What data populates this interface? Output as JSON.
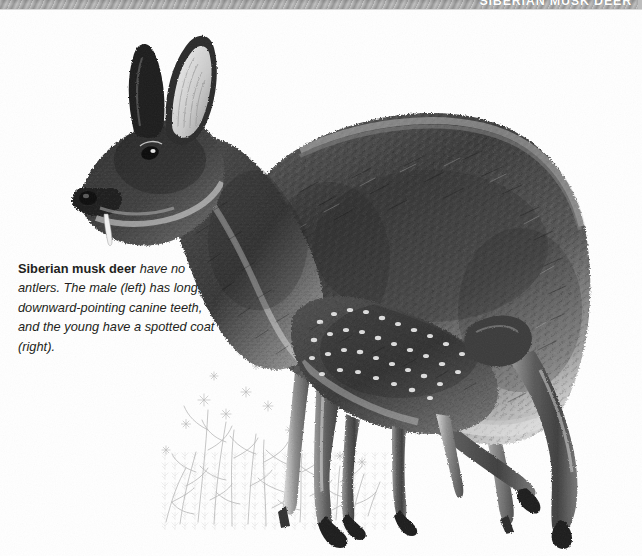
{
  "page": {
    "width": 642,
    "height": 556,
    "background_color": "#ffffff",
    "type": "illustrated-reference-page"
  },
  "header": {
    "title": "SIBERIAN MUSK DEER",
    "banner_color": "#9b9b9b",
    "title_color": "#ffffff",
    "note": "title is clipped by the top edge of the screenshot"
  },
  "caption": {
    "lead": "Siberian musk deer",
    "body": " have no antlers. The male (left) has long, downward-pointing canine teeth, and the young have a spotted coat (right).",
    "full_text": "Siberian musk deer have no antlers. The male (left) has long, downward-pointing canine teeth, and the young have a spotted coat (right).",
    "lines": [
      "Siberian musk deer have",
      "no antlers. The male (left)",
      "has long, downward-pointing",
      "canine teeth, and the young",
      "have a spotted coat (right)."
    ],
    "text_color": "#231f20"
  },
  "illustration": {
    "subject": "Siberian musk deer",
    "description": "Grayscale pen-and-ink style illustration of an adult Siberian musk deer standing in profile facing left, with a spotted fawn standing beneath and behind it, and sketched grass and wildflowers at its feet.",
    "style": "monochrome stipple / hatched line art",
    "elements": [
      {
        "name": "adult-musk-deer",
        "label": "male (left)",
        "detail": "no antlers, long downward-pointing canine tusks, arched back, large ears, short front legs and long hind legs"
      },
      {
        "name": "fawn-musk-deer",
        "label": "young (right)",
        "detail": "spotted coat, standing under the adult's belly"
      },
      {
        "name": "foreground-vegetation",
        "label": "grass and wildflowers",
        "detail": "light gray sketched herbaceous plants at the lower left of the animals"
      }
    ],
    "palette": {
      "darkest_fur": "#1a1a1a",
      "mid_fur": "#6b6b6b",
      "light_fur": "#c9c9c9",
      "highlight": "#f2f2f2",
      "vegetation": "#b8b8b8",
      "background": "#ffffff"
    }
  }
}
